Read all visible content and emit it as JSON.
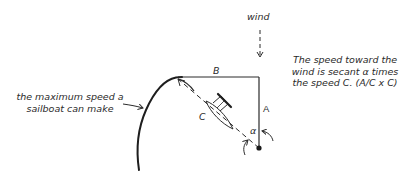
{
  "diagram": {
    "wind_label": "wind",
    "label_A": "A",
    "label_B": "B",
    "label_C": "C",
    "label_alpha": "α",
    "annotation_right": {
      "lines": [
        "The speed toward the",
        "wind is secant α times",
        "the speed C. (A/C x C)"
      ]
    },
    "annotation_left": {
      "lines": [
        "the maximum speed a",
        "sailboat can make"
      ]
    },
    "colors": {
      "ink": "#2b2b2b",
      "background": "#ffffff"
    }
  }
}
